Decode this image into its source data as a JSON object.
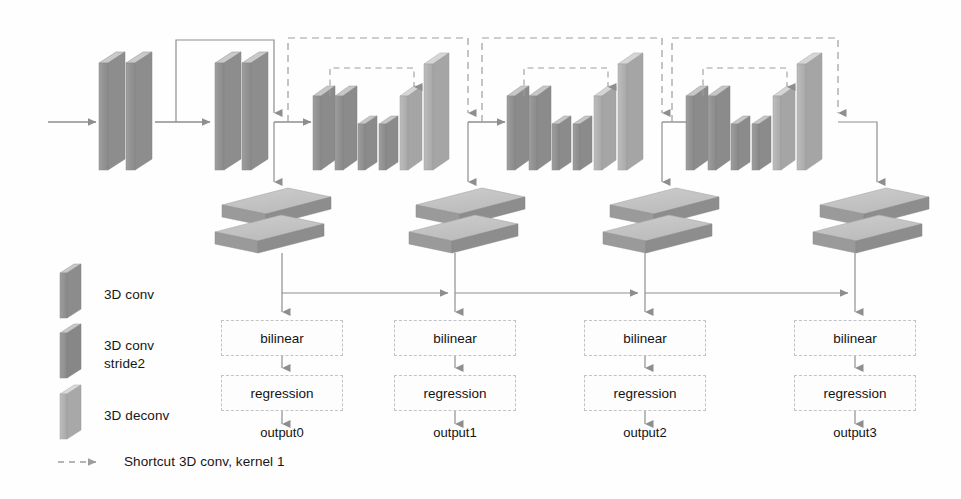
{
  "figure": {
    "type": "diagram"
  },
  "colors": {
    "conv_face": "#9a9a9a",
    "conv_top": "#c9c9c9",
    "conv_side": "#8a8a8a",
    "stride2_face": "#8d8d8d",
    "deconv_face": "#b5b5b5",
    "deconv_top": "#d8d8d8",
    "slab_top": "#c4c4c4",
    "slab_front": "#9c9c9c",
    "arrow": "#8e8e8e",
    "dashed": "#9d9d9d",
    "box_border": "#c3c3c3",
    "text": "#161616",
    "background": "#fefefe"
  },
  "legend": {
    "items": [
      {
        "key": "conv",
        "label": "3D conv",
        "icon": "conv-block-icon"
      },
      {
        "key": "stride2",
        "label": "3D conv\nstride2",
        "label_line1": "3D conv",
        "label_line2": "stride2",
        "icon": "conv-stride2-block-icon"
      },
      {
        "key": "deconv",
        "label": "3D deconv",
        "icon": "deconv-block-icon"
      }
    ],
    "shortcut": {
      "label": "Shortcut 3D conv, kernel 1",
      "icon": "dashed-arrow-icon"
    }
  },
  "stages": [
    {
      "id": 0,
      "bilinear_label": "bilinear",
      "regression_label": "regression",
      "output_label": "output0"
    },
    {
      "id": 1,
      "bilinear_label": "bilinear",
      "regression_label": "regression",
      "output_label": "output1"
    },
    {
      "id": 2,
      "bilinear_label": "bilinear",
      "regression_label": "regression",
      "output_label": "output2"
    },
    {
      "id": 3,
      "bilinear_label": "bilinear",
      "regression_label": "regression",
      "output_label": "output3"
    }
  ],
  "layout": {
    "bilinear_row_y": 320,
    "regression_row_y": 375,
    "output_row_y": 432,
    "bus_line_y": 293,
    "stage_x_centers": [
      282,
      455,
      645,
      855
    ],
    "box_width": 122,
    "box_height": 36
  }
}
